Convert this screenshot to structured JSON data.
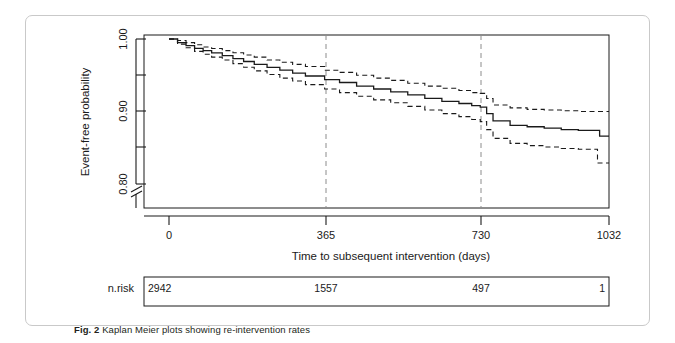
{
  "figure": {
    "caption_label": "Fig. 2",
    "caption_text": "Kaplan Meier plots showing re-intervention rates"
  },
  "risk_table": {
    "row_label": "n.risk",
    "values": [
      "2942",
      "1557",
      "497",
      "1"
    ]
  },
  "colors": {
    "curve": "#1a1a1a",
    "ci": "#1a1a1a",
    "axis": "#1a1a1a",
    "reference_line": "#8c8c8c",
    "card_border": "#c9c9c9"
  },
  "chart_data": {
    "type": "line",
    "title": "",
    "subtitle": "",
    "xlabel": "Time to subsequent intervention (days)",
    "ylabel": "Event-free probability",
    "xlim": [
      0,
      1032
    ],
    "ylim": [
      0.795,
      1.0
    ],
    "y_axis_break": true,
    "grid": false,
    "legend": "none",
    "xticks": [
      0,
      365,
      730,
      1032
    ],
    "xtick_labels": [
      "0",
      "365",
      "730",
      "1032"
    ],
    "yticks": [
      0.8,
      0.85,
      0.9,
      0.95,
      1.0
    ],
    "ytick_labels": [
      "0.80",
      "",
      "0.90",
      "",
      "1.00"
    ],
    "reference_lines_x": [
      365,
      730
    ],
    "series": [
      {
        "name": "Event-free probability (Kaplan-Meier estimate)",
        "style": "solid",
        "x": [
          0,
          20,
          40,
          60,
          80,
          100,
          125,
          150,
          175,
          200,
          230,
          260,
          290,
          320,
          365,
          400,
          440,
          480,
          520,
          560,
          600,
          640,
          680,
          710,
          730,
          745,
          760,
          800,
          840,
          880,
          920,
          960,
          985,
          1010,
          1032
        ],
        "y": [
          1.0,
          0.995,
          0.991,
          0.987,
          0.984,
          0.981,
          0.977,
          0.973,
          0.969,
          0.965,
          0.961,
          0.957,
          0.953,
          0.949,
          0.944,
          0.94,
          0.935,
          0.931,
          0.927,
          0.923,
          0.918,
          0.914,
          0.911,
          0.908,
          0.906,
          0.897,
          0.887,
          0.881,
          0.879,
          0.877,
          0.875,
          0.874,
          0.874,
          0.866,
          0.866
        ]
      },
      {
        "name": "Upper 95% confidence limit",
        "style": "dashed",
        "x": [
          0,
          20,
          40,
          60,
          80,
          100,
          125,
          150,
          175,
          200,
          230,
          260,
          290,
          320,
          365,
          400,
          440,
          480,
          520,
          560,
          600,
          640,
          680,
          710,
          730,
          745,
          760,
          800,
          840,
          880,
          920,
          960,
          1010,
          1032
        ],
        "y": [
          1.0,
          0.998,
          0.995,
          0.992,
          0.989,
          0.987,
          0.984,
          0.981,
          0.978,
          0.975,
          0.971,
          0.968,
          0.965,
          0.962,
          0.957,
          0.954,
          0.95,
          0.946,
          0.943,
          0.939,
          0.935,
          0.932,
          0.929,
          0.926,
          0.925,
          0.918,
          0.909,
          0.905,
          0.903,
          0.902,
          0.901,
          0.9,
          0.9,
          0.9
        ]
      },
      {
        "name": "Lower 95% confidence limit",
        "style": "dashed",
        "x": [
          0,
          20,
          40,
          60,
          80,
          100,
          125,
          150,
          175,
          200,
          230,
          260,
          290,
          320,
          365,
          400,
          440,
          480,
          520,
          560,
          600,
          640,
          680,
          710,
          730,
          745,
          760,
          800,
          840,
          880,
          920,
          960,
          985,
          1005,
          1032
        ],
        "y": [
          1.0,
          0.993,
          0.988,
          0.983,
          0.979,
          0.975,
          0.971,
          0.966,
          0.961,
          0.956,
          0.951,
          0.946,
          0.942,
          0.937,
          0.931,
          0.926,
          0.921,
          0.916,
          0.912,
          0.907,
          0.902,
          0.897,
          0.893,
          0.889,
          0.886,
          0.875,
          0.863,
          0.856,
          0.853,
          0.851,
          0.849,
          0.848,
          0.848,
          0.829,
          0.829
        ]
      }
    ],
    "risk_table": {
      "label": "n.risk",
      "times": [
        0,
        365,
        730,
        1032
      ],
      "counts": [
        2942,
        1557,
        497,
        1
      ]
    }
  }
}
